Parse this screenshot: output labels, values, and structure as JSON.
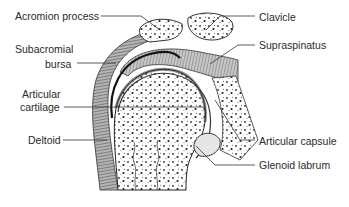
{
  "diagram": {
    "labels": {
      "acromion_process": "Acromion process",
      "subacromial_bursa_line1": "Subacromial",
      "subacromial_bursa_line2": "bursa",
      "articular_cartilage_line1": "Articular",
      "articular_cartilage_line2": "cartilage",
      "deltoid": "Deltoid",
      "clavicle": "Clavicle",
      "supraspinatus": "Supraspinatus",
      "articular_capsule": "Articular capsule",
      "glenoid_labrum": "Glenoid labrum"
    },
    "colors": {
      "ink": "#2a2a2a",
      "muscle_fill": "#8c8c8c",
      "bone_fill": "#ffffff",
      "background": "#ffffff"
    }
  }
}
